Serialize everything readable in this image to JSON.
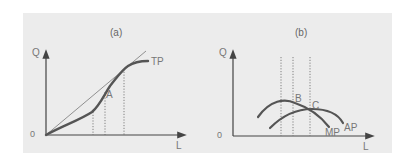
{
  "figure": {
    "panel_color": "#ececec",
    "curve_color": "#555555",
    "axis_color": "#444444",
    "label_color": "#777777",
    "panel_a": {
      "title": "(a)",
      "y_axis_label": "Q",
      "x_axis_label": "L",
      "origin_label": "0",
      "curve_label": "TP",
      "point_label": "A"
    },
    "panel_b": {
      "title": "(b)",
      "y_axis_label": "Q",
      "x_axis_label": "L",
      "origin_label": "0",
      "point_b_label": "B",
      "point_c_label": "C",
      "mp_label": "MP",
      "ap_label": "AP"
    }
  }
}
